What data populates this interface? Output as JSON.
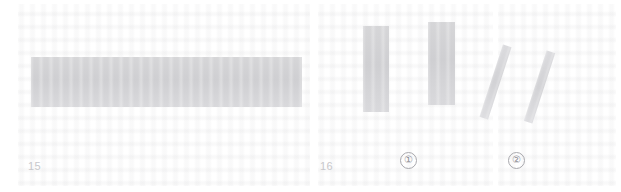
{
  "page": {
    "width": 621,
    "height": 192,
    "background_color": "#ffffff"
  },
  "blocks": {
    "wide_block": {
      "name": "wide-gray-block",
      "color": "#d3d3d6"
    },
    "bar_1": {
      "name": "vertical-gray-bar-1",
      "color": "#d3d3d6"
    },
    "bar_2": {
      "name": "vertical-gray-bar-2",
      "color": "#d3d3d6"
    },
    "diagonal_1": {
      "name": "diagonal-gray-bar-1",
      "color": "#d8d8db"
    },
    "diagonal_2": {
      "name": "diagonal-gray-bar-2",
      "color": "#d8d8db"
    }
  },
  "labels": {
    "page_number_left": "15",
    "page_number_mid": "16",
    "figure_marker_1": "①",
    "figure_marker_2": "②",
    "label_color": "#c8c8cc",
    "marker_color": "#8e8e94"
  }
}
